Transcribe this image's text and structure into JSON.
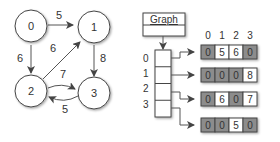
{
  "graph": {
    "nodes": [
      {
        "id": "0",
        "label": "0",
        "x": 31,
        "y": 26
      },
      {
        "id": "1",
        "label": "1",
        "x": 92,
        "y": 26
      },
      {
        "id": "2",
        "label": "2",
        "x": 31,
        "y": 92
      },
      {
        "id": "3",
        "label": "3",
        "x": 92,
        "y": 100
      }
    ],
    "edges": [
      {
        "from": "0",
        "to": "1",
        "weight": "5"
      },
      {
        "from": "0",
        "to": "2",
        "weight": "6"
      },
      {
        "from": "2",
        "to": "1",
        "weight": "6"
      },
      {
        "from": "1",
        "to": "3",
        "weight": "8"
      },
      {
        "from": "2",
        "to": "3",
        "weight": "7"
      },
      {
        "from": "3",
        "to": "2",
        "weight": "5"
      }
    ]
  },
  "structure": {
    "class_name": "Graph",
    "row_labels": [
      "0",
      "1",
      "2",
      "3"
    ],
    "column_labels": [
      "0",
      "1",
      "2",
      "3"
    ],
    "matrix": [
      [
        "0",
        "5",
        "6",
        "0"
      ],
      [
        "0",
        "0",
        "0",
        "8"
      ],
      [
        "0",
        "6",
        "0",
        "7"
      ],
      [
        "0",
        "0",
        "5",
        "0"
      ]
    ]
  },
  "colors": {
    "zero_cell": "#8c8c8c",
    "value_cell": "#ffffff",
    "stroke": "#444444"
  }
}
